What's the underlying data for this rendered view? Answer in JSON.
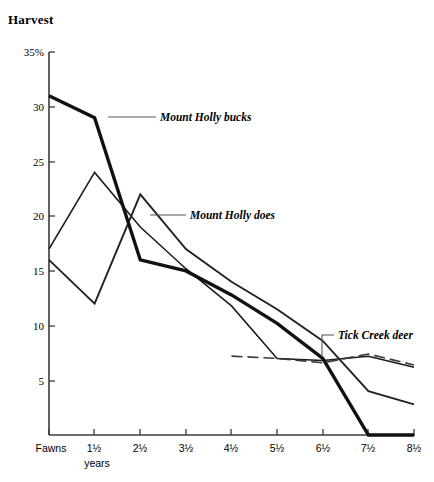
{
  "chart_data": {
    "type": "line",
    "title": "Harvest",
    "xlabel": "years",
    "ylabel": "",
    "ylim": [
      0,
      35
    ],
    "yticks": [
      5,
      10,
      15,
      20,
      25,
      30,
      35
    ],
    "ytick_labels": [
      "5",
      "10",
      "15",
      "20",
      "25",
      "30",
      "35%"
    ],
    "categories": [
      "Fawns",
      "1½",
      "2½",
      "3½",
      "4½",
      "5½",
      "6½",
      "7½",
      "8½"
    ],
    "grid": false,
    "legend": "inline-annotations",
    "series": [
      {
        "name": "Mount Holly bucks",
        "style": "thick-solid",
        "values": [
          31,
          29,
          16,
          15,
          12.8,
          10.2,
          7.0,
          0,
          0
        ]
      },
      {
        "name": "Mount Holly does",
        "style": "medium-solid",
        "values": [
          16,
          12,
          22,
          17,
          14,
          11.5,
          8.6,
          4.0,
          2.8
        ]
      },
      {
        "name": "Mount Holly does thin",
        "style": "thin-solid",
        "values": [
          17,
          24,
          19,
          15.2,
          11.8,
          7.0,
          6.8,
          7.2,
          6.2
        ]
      },
      {
        "name": "Tick Creek deer",
        "style": "dashed",
        "values": [
          null,
          null,
          null,
          null,
          7.2,
          7.0,
          6.6,
          7.4,
          6.4
        ]
      }
    ],
    "annotations": [
      {
        "id": "ann-bucks",
        "text": "Mount Holly bucks"
      },
      {
        "id": "ann-does",
        "text": "Mount Holly does"
      },
      {
        "id": "ann-tick",
        "text": "Tick Creek deer"
      }
    ],
    "caption": ""
  },
  "axis": {
    "y_title": "Harvest",
    "x_sub_label": "years"
  }
}
